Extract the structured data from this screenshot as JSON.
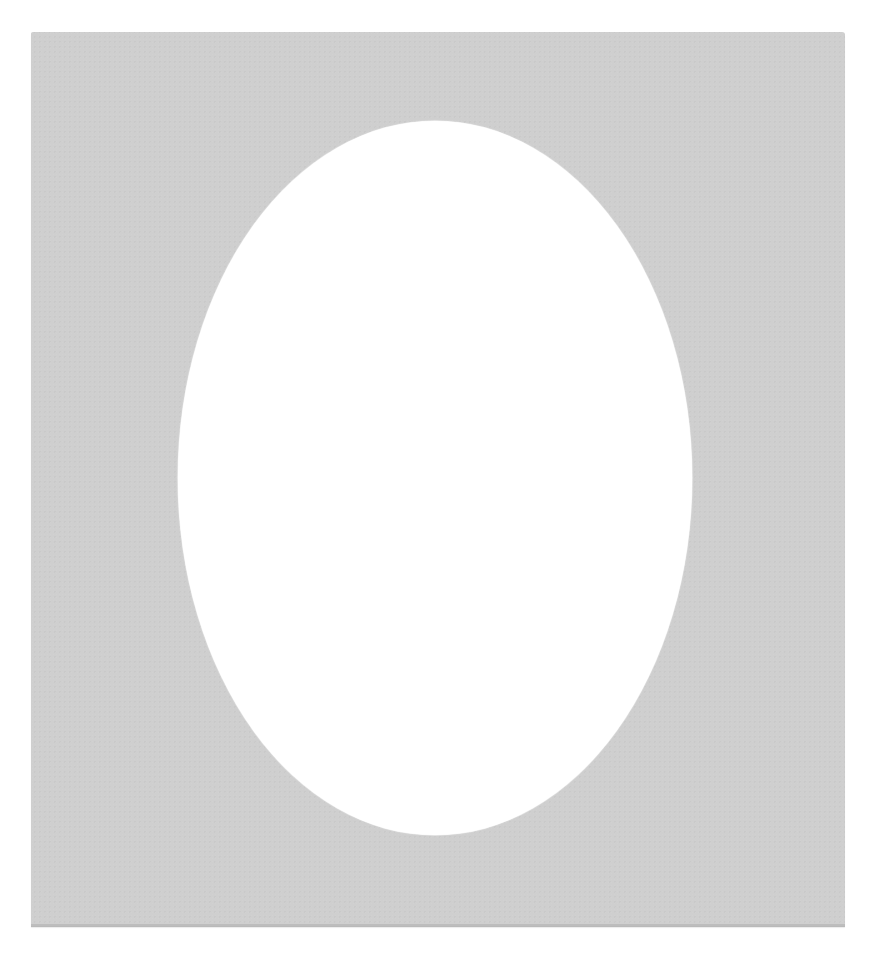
{
  "scene": {
    "subject": "Photo mat board with oval opening",
    "background_color": "#ffffff",
    "mat": {
      "color": "#cfcfcf",
      "edge_color": "#bdbdbd",
      "opening_shape": "oval",
      "opening_color": "#ffffff"
    }
  }
}
